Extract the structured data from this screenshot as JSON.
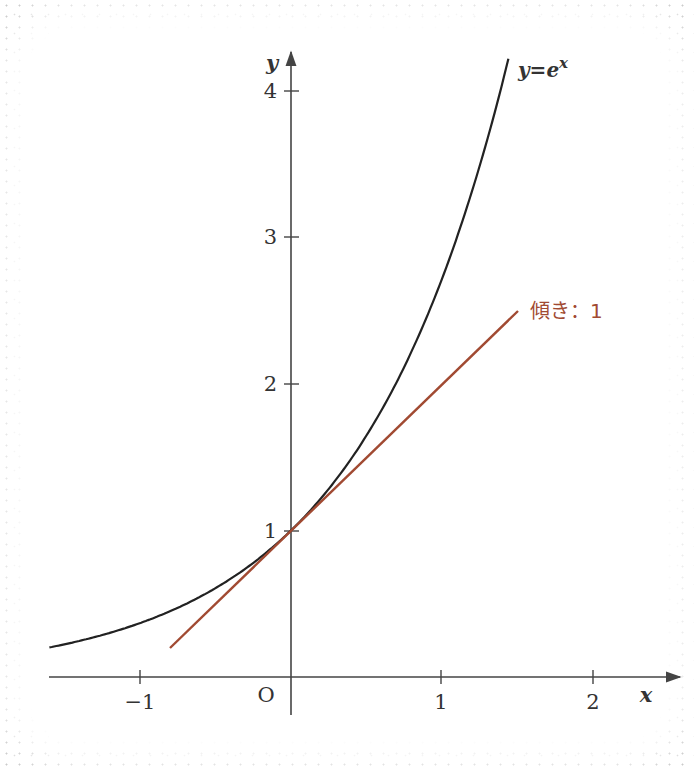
{
  "chart_data": {
    "type": "line",
    "title": "",
    "xlabel": "x",
    "ylabel": "y",
    "xlim": [
      -1.6,
      2.3
    ],
    "ylim": [
      0,
      4.3
    ],
    "grid": false,
    "x_ticks": [
      {
        "value": -1,
        "label": "−1"
      },
      {
        "value": 1,
        "label": "1"
      },
      {
        "value": 2,
        "label": "2"
      }
    ],
    "y_ticks": [
      {
        "value": 1,
        "label": "1"
      },
      {
        "value": 2,
        "label": "2"
      },
      {
        "value": 3,
        "label": "3"
      },
      {
        "value": 4,
        "label": "4"
      }
    ],
    "origin_label": "O",
    "series": [
      {
        "name": "y=e^x",
        "label": "y=e",
        "label_sup": "x",
        "color": "#222222",
        "function": "exp",
        "x_range": [
          -1.6,
          1.44
        ]
      },
      {
        "name": "tangent",
        "label": "傾き：1",
        "color": "#a14a32",
        "function": "x+1",
        "x_range": [
          -0.8,
          1.5
        ]
      }
    ],
    "annotations": [
      {
        "text": "y=e^x",
        "near": "curve top"
      },
      {
        "text": "傾き：1",
        "near": "tangent line end"
      }
    ]
  },
  "labels": {
    "x_axis": "x",
    "y_axis": "y",
    "origin": "O",
    "tick_x_neg1": "−1",
    "tick_x_1": "1",
    "tick_x_2": "2",
    "tick_y_1": "1",
    "tick_y_2": "2",
    "tick_y_3": "3",
    "tick_y_4": "4",
    "curve_label_base": "y=e",
    "curve_label_sup": "x",
    "slope_label": "傾き：1"
  },
  "colors": {
    "axis": "#444444",
    "curve": "#222222",
    "tangent": "#a14a32"
  }
}
